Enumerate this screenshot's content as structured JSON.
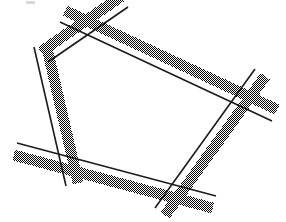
{
  "figure": {
    "canvas": {
      "width": 286,
      "height": 222,
      "background_color": "#ffffff"
    },
    "style": {
      "line_color": "#1a1a1a",
      "line_width": 1.6,
      "band_fill": "dotted-50-percent-checkerboard",
      "band_dot_color": "#000000",
      "band_width": 11,
      "band_offset": 7
    },
    "shape_name": "irregular-pentagon",
    "stroke_count": 5,
    "crossing_count": 5,
    "strokes": [
      {
        "id": "stroke-top",
        "label": "top edge",
        "x1": 128,
        "y1": 7,
        "x2": 48,
        "y2": 62,
        "band_side": "above"
      },
      {
        "id": "stroke-upper-right",
        "label": "upper right edge",
        "x1": 60,
        "y1": 22,
        "x2": 272,
        "y2": 121,
        "band_side": "above"
      },
      {
        "id": "stroke-left",
        "label": "left edge",
        "x1": 34,
        "y1": 47,
        "x2": 66,
        "y2": 186,
        "band_side": "left"
      },
      {
        "id": "stroke-bottom",
        "label": "bottom edge",
        "x1": 17,
        "y1": 143,
        "x2": 216,
        "y2": 196,
        "band_side": "below"
      },
      {
        "id": "stroke-right",
        "label": "right edge",
        "x1": 255,
        "y1": 69,
        "x2": 155,
        "y2": 208,
        "band_side": "right"
      }
    ],
    "crossings": [
      {
        "id": "crossing-top-left",
        "x": 96,
        "y": 41,
        "strokes": [
          "stroke-top",
          "stroke-upper-right"
        ]
      },
      {
        "id": "crossing-left",
        "x": 42,
        "y": 79,
        "strokes": [
          "stroke-top",
          "stroke-left"
        ]
      },
      {
        "id": "crossing-bottom-left",
        "x": 57,
        "y": 154,
        "strokes": [
          "stroke-left",
          "stroke-bottom"
        ]
      },
      {
        "id": "crossing-bottom-right",
        "x": 167,
        "y": 184,
        "strokes": [
          "stroke-bottom",
          "stroke-right"
        ]
      },
      {
        "id": "crossing-right",
        "x": 237,
        "y": 105,
        "strokes": [
          "stroke-upper-right",
          "stroke-right"
        ]
      }
    ],
    "speck": {
      "id": "corner-speck",
      "x": 26,
      "y": 1,
      "width": 9,
      "height": 3,
      "color": "#d8d8d8"
    }
  }
}
